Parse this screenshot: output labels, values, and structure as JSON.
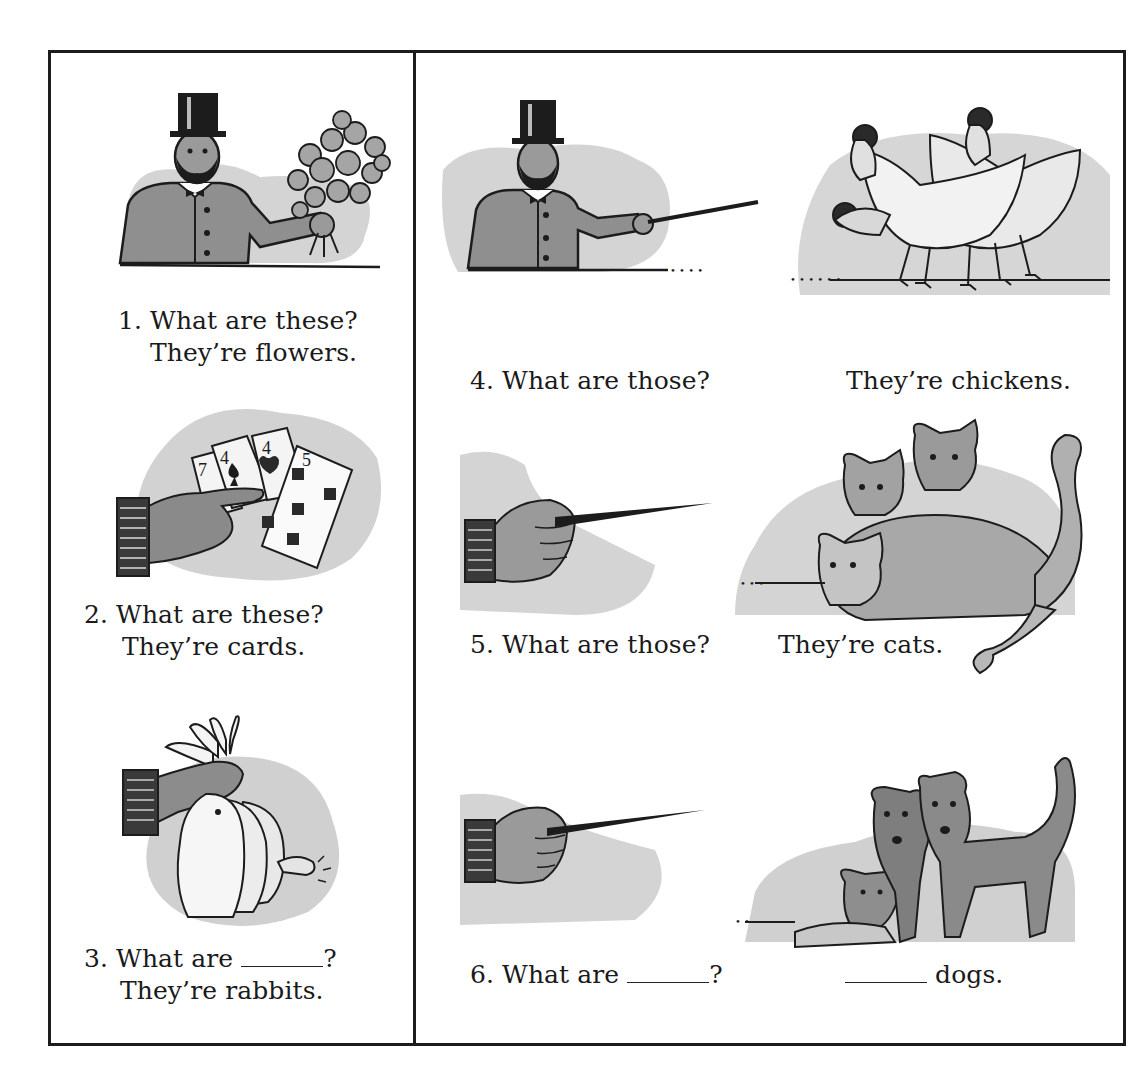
{
  "worksheet": {
    "left_column": [
      {
        "number": "1.",
        "question": "What are these?",
        "answer": "They’re flowers.",
        "picture": "man-top-hat-holding-flowers"
      },
      {
        "number": "2.",
        "question": "What are these?",
        "answer": "They’re cards.",
        "picture": "hand-holding-playing-cards",
        "cards": [
          "7",
          "4",
          "4",
          "5"
        ]
      },
      {
        "number": "3.",
        "question_prefix": "What are",
        "question_suffix": "?",
        "answer": "They’re rabbits.",
        "picture": "hand-holding-rabbits-by-ears"
      }
    ],
    "right_column": [
      {
        "number": "4.",
        "question": "What are those?",
        "answer": "They’re chickens.",
        "picture_left": "man-top-hat-pointing-stick",
        "picture_right": "chickens"
      },
      {
        "number": "5.",
        "question": "What are those?",
        "answer": "They’re cats.",
        "picture_left": "hand-pointing-stick",
        "picture_right": "cats"
      },
      {
        "number": "6.",
        "question_prefix": "What are",
        "question_suffix": "?",
        "answer_suffix": "dogs.",
        "picture_left": "hand-pointing-stick",
        "picture_right": "dogs"
      }
    ]
  },
  "colors": {
    "ink": "#1c1c1c",
    "wash": "#cfcfcf",
    "paper": "#ffffff"
  }
}
